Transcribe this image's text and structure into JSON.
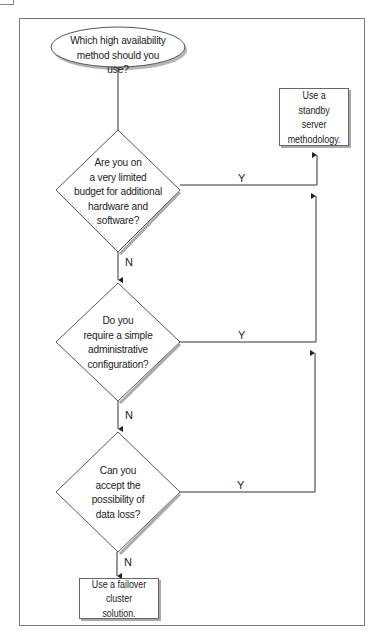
{
  "flowchart": {
    "start": {
      "text": "Which high availability method should you use?",
      "lines": [
        "Which high availability",
        "method should you use?"
      ]
    },
    "decisions": [
      {
        "id": "budget",
        "lines": [
          "Are you on",
          "a very limited",
          "budget for additional",
          "hardware and",
          "software?"
        ],
        "yes_label": "Y",
        "no_label": "N"
      },
      {
        "id": "simple-admin",
        "lines": [
          "Do you",
          "require a simple",
          "administrative",
          "configuration?"
        ],
        "yes_label": "Y",
        "no_label": "N"
      },
      {
        "id": "data-loss",
        "lines": [
          "Can you",
          "accept the",
          "possibility of",
          "data loss?"
        ],
        "yes_label": "Y",
        "no_label": "N"
      }
    ],
    "outcomes": {
      "standby": {
        "lines": [
          "Use a standby",
          "server",
          "methodology."
        ]
      },
      "failover": {
        "lines": [
          "Use a failover",
          "cluster solution."
        ]
      }
    }
  },
  "colors": {
    "line": "#333333",
    "shadow": "#aaaaaa",
    "frame": "#777777"
  }
}
